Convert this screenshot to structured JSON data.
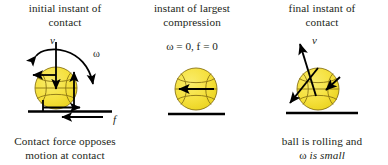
{
  "figure": {
    "title_caption_font_color": "#231f20",
    "background": "#ffffff",
    "ball_color": "#f5e03c",
    "ball_shade": "#efd92a",
    "ball_outline": "#8a7414",
    "arrow_color": "#000000",
    "ground_color": "#000000"
  },
  "panels": [
    {
      "id": "initial",
      "title_line1": "initial instant of",
      "title_line2": "contact",
      "caption_line1": "Contact force opposes",
      "caption_line2": "motion at contact",
      "labels": {
        "velocity": "v",
        "omega": "ω",
        "friction": "f"
      },
      "vectors": [
        {
          "name": "velocity-arrow",
          "direction": "down",
          "label": "v"
        },
        {
          "name": "spin-arrow",
          "direction": "clockwise-curved",
          "label": "ω"
        },
        {
          "name": "contact-point-velocity-arrow",
          "direction": "left"
        },
        {
          "name": "normal-force-arrow",
          "direction": "up"
        },
        {
          "name": "surface-reaction-arrow",
          "direction": "right"
        },
        {
          "name": "friction-force-arrow",
          "direction": "left",
          "label": "f"
        }
      ]
    },
    {
      "id": "compression",
      "title_line1": "instant of largest",
      "title_line2": "compression",
      "equation": "ω = 0,  f = 0",
      "labels": {},
      "vectors": [
        {
          "name": "velocity-arrow",
          "direction": "left"
        }
      ]
    },
    {
      "id": "final",
      "title_line1": "final instant of",
      "title_line2": "contact",
      "caption_line1": "ball is  rolling and",
      "caption_line2_plain": "ω ",
      "caption_line2_italic": "is small",
      "labels": {
        "velocity": "v"
      },
      "vectors": [
        {
          "name": "velocity-arrow",
          "direction": "up-right",
          "label": "v"
        },
        {
          "name": "contact-velocity-arrow",
          "direction": "down-left"
        },
        {
          "name": "inward-arrow",
          "direction": "down-left-small"
        }
      ]
    }
  ]
}
